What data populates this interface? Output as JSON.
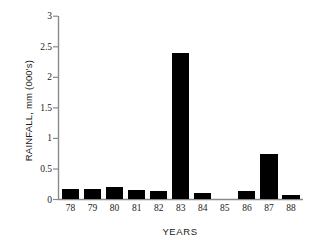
{
  "chart_data": {
    "type": "bar",
    "title": "",
    "xlabel": "YEARS",
    "ylabel": "RAINFALL, mm (000's)",
    "categories": [
      "78",
      "79",
      "80",
      "81",
      "82",
      "83",
      "84",
      "85",
      "86",
      "87",
      "88"
    ],
    "values": [
      0.17,
      0.17,
      0.2,
      0.15,
      0.14,
      2.4,
      0.1,
      0.0,
      0.14,
      0.75,
      0.07
    ],
    "ylim": [
      0,
      3
    ],
    "yticks": [
      "0",
      "0.5",
      "1",
      "1.5",
      "2",
      "2.5",
      "3"
    ],
    "ytick_values": [
      0,
      0.5,
      1,
      1.5,
      2,
      2.5,
      3
    ],
    "grid": false,
    "legend": "none",
    "bar_color": "#000000",
    "axis_color": "#808080",
    "background_color": "#ffffff"
  }
}
